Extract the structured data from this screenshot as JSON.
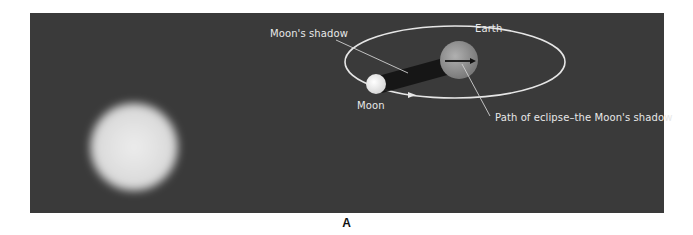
{
  "figure": {
    "caption": "A",
    "background_color": "#3a3a3a",
    "labels": {
      "moons_shadow": "Moon's shadow",
      "earth": "Earth",
      "moon": "Moon",
      "path_of_eclipse": "Path of eclipse–the Moon's shadow"
    },
    "objects": [
      {
        "name": "Sun",
        "shape": "blurred-disc",
        "color": "#e6e6e6"
      },
      {
        "name": "Moon",
        "shape": "disc",
        "color": "#f2f2f2"
      },
      {
        "name": "Earth",
        "shape": "disc",
        "color": "#9a9a9a"
      },
      {
        "name": "Moon orbit",
        "shape": "ellipse",
        "color": "#e0e0e0"
      },
      {
        "name": "Moon's shadow cone",
        "shape": "cone",
        "color": "#111111"
      }
    ]
  }
}
